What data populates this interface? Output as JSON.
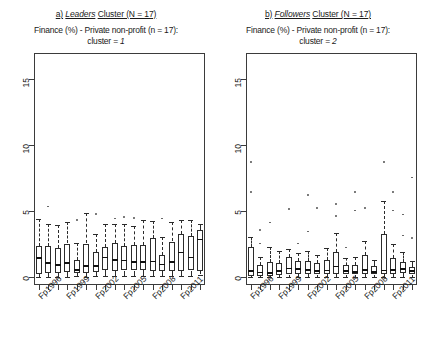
{
  "figure": {
    "panels": [
      {
        "letter": "a)",
        "cluster_word": "Leaders",
        "cluster_suffix": "Cluster (N = 17)",
        "subtitle_line1": "Finance (%) - Private non-profit (n = 17):",
        "subtitle_line2_prefix": "cluster = ",
        "subtitle_line2_value": "1"
      },
      {
        "letter": "b)",
        "cluster_word": "Followers",
        "cluster_suffix": "Cluster (N = 17)",
        "subtitle_line1": "Finance (%) - Private non-profit (n = 17):",
        "subtitle_line2_prefix": "cluster = ",
        "subtitle_line2_value": "2"
      }
    ]
  },
  "chart_data": [
    {
      "type": "box",
      "panel_id": "leaders",
      "title": "a) Leaders Cluster (N = 17)",
      "subtitle": "Finance (%) - Private non-profit (n = 17): cluster = 1",
      "xlabel": "",
      "ylabel": "",
      "ylim": [
        -0.6,
        17.0
      ],
      "yticks": [
        0,
        5,
        10,
        15
      ],
      "ytick_labels": [
        "0",
        "5",
        "10",
        "15"
      ],
      "grid": false,
      "n_boxes": 18,
      "categories": [
        "Fp1996",
        "Fp1997",
        "Fp1998",
        "Fp1999",
        "Fp2000",
        "Fp2001",
        "Fp2002",
        "Fp2003",
        "Fp2004",
        "Fp2005",
        "Fp2006",
        "Fp2007",
        "Fp2008",
        "Fp2009",
        "Fp2010",
        "Fp2011",
        "Fp2012",
        "Fp2013"
      ],
      "xtick_labels_shown": [
        "Fp1996",
        "Fp1999",
        "Fp2002",
        "Fp2005",
        "Fp2008",
        "Fp2011"
      ],
      "xtick_labels_shown_at": [
        0,
        3,
        6,
        9,
        12,
        15
      ],
      "boxes": [
        {
          "category": "Fp1996",
          "whisker_low": 0.0,
          "q1": 0.25,
          "median": 1.45,
          "q3": 2.35,
          "whisker_high": 4.4,
          "outliers": []
        },
        {
          "category": "Fp1997",
          "whisker_low": 0.0,
          "q1": 0.3,
          "median": 1.05,
          "q3": 2.35,
          "whisker_high": 4.0,
          "outliers": [
            5.35
          ]
        },
        {
          "category": "Fp1998",
          "whisker_low": 0.0,
          "q1": 0.3,
          "median": 0.9,
          "q3": 2.2,
          "whisker_high": 3.95,
          "outliers": []
        },
        {
          "category": "Fp1999",
          "whisker_low": 0.0,
          "q1": 0.4,
          "median": 1.05,
          "q3": 2.55,
          "whisker_high": 4.15,
          "outliers": []
        },
        {
          "category": "Fp2000",
          "whisker_low": 0.05,
          "q1": 0.3,
          "median": 0.55,
          "q3": 1.3,
          "whisker_high": 2.6,
          "outliers": [
            4.35
          ]
        },
        {
          "category": "Fp2001",
          "whisker_low": 0.0,
          "q1": 0.35,
          "median": 0.85,
          "q3": 2.55,
          "whisker_high": 4.85,
          "outliers": []
        },
        {
          "category": "Fp2002",
          "whisker_low": 0.05,
          "q1": 0.4,
          "median": 0.85,
          "q3": 1.9,
          "whisker_high": 3.3,
          "outliers": [
            4.8
          ]
        },
        {
          "category": "Fp2003",
          "whisker_low": 0.05,
          "q1": 0.55,
          "median": 1.5,
          "q3": 2.25,
          "whisker_high": 4.05,
          "outliers": []
        },
        {
          "category": "Fp2004",
          "whisker_low": 0.05,
          "q1": 0.45,
          "median": 1.3,
          "q3": 2.6,
          "whisker_high": 4.05,
          "outliers": [
            4.45
          ]
        },
        {
          "category": "Fp2005",
          "whisker_low": 0.05,
          "q1": 0.5,
          "median": 1.25,
          "q3": 2.35,
          "whisker_high": 4.05,
          "outliers": [
            4.55
          ]
        },
        {
          "category": "Fp2006",
          "whisker_low": 0.05,
          "q1": 0.5,
          "median": 1.15,
          "q3": 2.45,
          "whisker_high": 3.9,
          "outliers": [
            4.5
          ]
        },
        {
          "category": "Fp2007",
          "whisker_low": 0.05,
          "q1": 0.55,
          "median": 1.15,
          "q3": 2.45,
          "whisker_high": 4.3,
          "outliers": []
        },
        {
          "category": "Fp2008",
          "whisker_low": 0.05,
          "q1": 0.45,
          "median": 1.2,
          "q3": 2.95,
          "whisker_high": 4.25,
          "outliers": []
        },
        {
          "category": "Fp2009",
          "whisker_low": 0.05,
          "q1": 0.45,
          "median": 0.95,
          "q3": 1.65,
          "whisker_high": 3.05,
          "outliers": [
            4.45
          ]
        },
        {
          "category": "Fp2010",
          "whisker_low": 0.05,
          "q1": 0.45,
          "median": 1.15,
          "q3": 2.7,
          "whisker_high": 4.2,
          "outliers": []
        },
        {
          "category": "Fp2011",
          "whisker_low": 0.05,
          "q1": 0.45,
          "median": 1.85,
          "q3": 3.25,
          "whisker_high": 4.35,
          "outliers": []
        },
        {
          "category": "Fp2012",
          "whisker_low": 0.1,
          "q1": 0.5,
          "median": 1.5,
          "q3": 3.15,
          "whisker_high": 4.3,
          "outliers": []
        },
        {
          "category": "Fp2013",
          "whisker_low": 0.2,
          "q1": 0.45,
          "median": 2.85,
          "q3": 3.55,
          "whisker_high": 4.05,
          "outliers": []
        }
      ]
    },
    {
      "type": "box",
      "panel_id": "followers",
      "title": "b) Followers Cluster (N = 17)",
      "subtitle": "Finance (%) - Private non-profit (n = 17): cluster = 2",
      "xlabel": "",
      "ylabel": "",
      "ylim": [
        -0.6,
        17.0
      ],
      "yticks": [
        0,
        5,
        10,
        15
      ],
      "ytick_labels": [
        "0",
        "5",
        "10",
        "15"
      ],
      "grid": false,
      "n_boxes": 18,
      "categories": [
        "Fp1996",
        "Fp1997",
        "Fp1998",
        "Fp1999",
        "Fp2000",
        "Fp2001",
        "Fp2002",
        "Fp2003",
        "Fp2004",
        "Fp2005",
        "Fp2006",
        "Fp2007",
        "Fp2008",
        "Fp2009",
        "Fp2010",
        "Fp2011",
        "Fp2012",
        "Fp2013"
      ],
      "xtick_labels_shown": [
        "Fp1996",
        "Fp1999",
        "Fp2002",
        "Fp2005",
        "Fp2008",
        "Fp2011"
      ],
      "xtick_labels_shown_at": [
        0,
        3,
        6,
        9,
        12,
        15
      ],
      "boxes": [
        {
          "category": "Fp1996",
          "whisker_low": 0.0,
          "q1": 0.1,
          "median": 0.45,
          "q3": 2.25,
          "whisker_high": 3.05,
          "outliers": [
            8.75,
            6.45
          ]
        },
        {
          "category": "Fp1997",
          "whisker_low": 0.0,
          "q1": 0.05,
          "median": 0.35,
          "q3": 0.95,
          "whisker_high": 1.55,
          "outliers": [
            2.55,
            3.55
          ]
        },
        {
          "category": "Fp1998",
          "whisker_low": 0.0,
          "q1": 0.1,
          "median": 0.3,
          "q3": 1.15,
          "whisker_high": 2.25,
          "outliers": [
            4.15
          ]
        },
        {
          "category": "Fp1999",
          "whisker_low": 0.0,
          "q1": 0.15,
          "median": 0.45,
          "q3": 1.1,
          "whisker_high": 1.95,
          "outliers": []
        },
        {
          "category": "Fp2000",
          "whisker_low": 0.0,
          "q1": 0.2,
          "median": 0.65,
          "q3": 1.55,
          "whisker_high": 2.15,
          "outliers": [
            5.15
          ]
        },
        {
          "category": "Fp2001",
          "whisker_low": 0.0,
          "q1": 0.25,
          "median": 0.6,
          "q3": 1.2,
          "whisker_high": 1.8,
          "outliers": [
            2.55
          ]
        },
        {
          "category": "Fp2002",
          "whisker_low": 0.0,
          "q1": 0.25,
          "median": 0.55,
          "q3": 1.25,
          "whisker_high": 1.95,
          "outliers": [
            6.25,
            3.45
          ]
        },
        {
          "category": "Fp2003",
          "whisker_low": 0.0,
          "q1": 0.2,
          "median": 0.45,
          "q3": 1.05,
          "whisker_high": 1.7,
          "outliers": [
            5.25
          ]
        },
        {
          "category": "Fp2004",
          "whisker_low": 0.0,
          "q1": 0.25,
          "median": 0.5,
          "q3": 1.3,
          "whisker_high": 2.2,
          "outliers": []
        },
        {
          "category": "Fp2005",
          "whisker_low": 0.0,
          "q1": 0.25,
          "median": 0.8,
          "q3": 1.9,
          "whisker_high": 3.35,
          "outliers": [
            5.55,
            4.65
          ]
        },
        {
          "category": "Fp2006",
          "whisker_low": 0.0,
          "q1": 0.2,
          "median": 0.45,
          "q3": 0.95,
          "whisker_high": 1.45,
          "outliers": [
            2.25
          ]
        },
        {
          "category": "Fp2007",
          "whisker_low": 0.0,
          "q1": 0.2,
          "median": 0.4,
          "q3": 0.95,
          "whisker_high": 1.55,
          "outliers": [
            6.45,
            5.05
          ]
        },
        {
          "category": "Fp2008",
          "whisker_low": 0.0,
          "q1": 0.25,
          "median": 0.55,
          "q3": 1.7,
          "whisker_high": 2.75,
          "outliers": [
            5.25
          ]
        },
        {
          "category": "Fp2009",
          "whisker_low": 0.0,
          "q1": 0.2,
          "median": 0.4,
          "q3": 0.85,
          "whisker_high": 1.3,
          "outliers": []
        },
        {
          "category": "Fp2010",
          "whisker_low": 0.0,
          "q1": 0.25,
          "median": 0.5,
          "q3": 3.25,
          "whisker_high": 5.75,
          "outliers": [
            8.75
          ]
        },
        {
          "category": "Fp2011",
          "whisker_low": 0.0,
          "q1": 0.25,
          "median": 0.55,
          "q3": 1.45,
          "whisker_high": 2.55,
          "outliers": [
            6.45,
            5.05
          ]
        },
        {
          "category": "Fp2012",
          "whisker_low": 0.0,
          "q1": 0.3,
          "median": 0.6,
          "q3": 1.15,
          "whisker_high": 1.9,
          "outliers": [
            4.75,
            3.15
          ]
        },
        {
          "category": "Fp2013",
          "whisker_low": 0.0,
          "q1": 0.2,
          "median": 0.45,
          "q3": 0.8,
          "whisker_high": 1.2,
          "outliers": [
            7.55,
            2.95
          ]
        }
      ]
    }
  ]
}
